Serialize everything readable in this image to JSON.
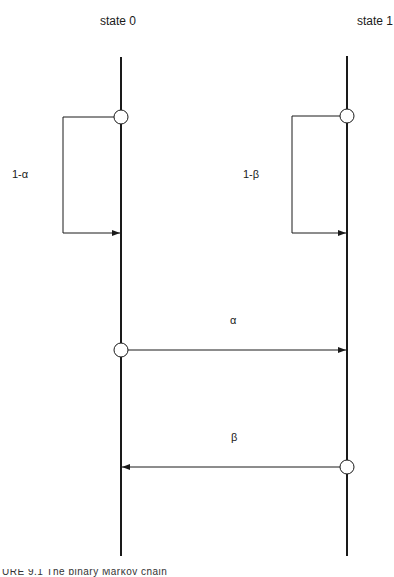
{
  "diagram": {
    "states": [
      {
        "id": "state0",
        "label": "state 0",
        "x": 121
      },
      {
        "id": "state1",
        "label": "state 1",
        "x": 347
      }
    ],
    "transitions": [
      {
        "from": "state0",
        "to": "state0",
        "label": "1-α",
        "type": "self-loop"
      },
      {
        "from": "state1",
        "to": "state1",
        "label": "1-β",
        "type": "self-loop"
      },
      {
        "from": "state0",
        "to": "state1",
        "label": "α",
        "type": "arrow"
      },
      {
        "from": "state1",
        "to": "state0",
        "label": "β",
        "type": "arrow"
      }
    ],
    "caption": "URE 9.1   The binary Markov chain"
  }
}
